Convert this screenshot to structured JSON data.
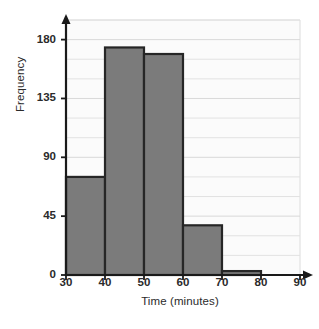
{
  "chart_data": {
    "type": "bar",
    "title": "",
    "subtitle": "",
    "xlabel": "Time (minutes)",
    "ylabel": "Frequency",
    "histogram": true,
    "bin_edges": [
      30,
      40,
      50,
      60,
      70,
      80,
      90
    ],
    "categories": [
      "30-40",
      "40-50",
      "50-60",
      "60-70",
      "70-80",
      "80-90"
    ],
    "values": [
      75,
      174,
      169,
      38,
      3,
      0
    ],
    "xlim": [
      30,
      90
    ],
    "ylim": [
      0,
      195
    ],
    "xticks": [
      30,
      40,
      50,
      60,
      70,
      80,
      90
    ],
    "xtick_labels": [
      "30",
      "40",
      "50",
      "60",
      "70",
      "80",
      "90"
    ],
    "yticks": [
      0,
      45,
      90,
      135,
      180
    ],
    "ytick_labels": [
      "0",
      "45",
      "90",
      "135",
      "180"
    ],
    "minor_ygrid_step": 15,
    "grid": "horizontal",
    "legend": "none",
    "bar_fill": "#7b7b7b",
    "bar_stroke": "#262626",
    "grid_color": "#e2e2e2",
    "axis_color": "#1a1a1a",
    "axis_arrows": [
      "y-up",
      "x-right"
    ],
    "plot_bg": "#fbfbfb",
    "annotations": []
  },
  "axes": {
    "y_title": "Frequency",
    "x_title": "Time (minutes)"
  }
}
